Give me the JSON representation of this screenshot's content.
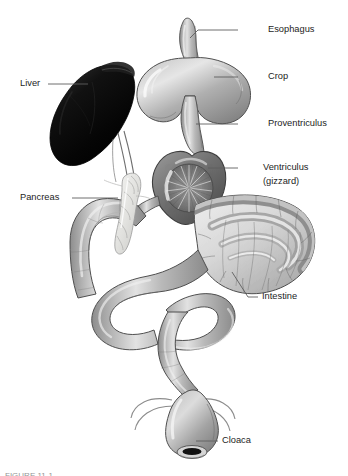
{
  "figure": {
    "caption_partial": "FIGURE 11-1",
    "background_color": "#ffffff",
    "line_color": "#5d5d5d",
    "text_color": "#1d1d1d"
  },
  "labels": [
    {
      "id": "esophagus",
      "text": "Esophagus",
      "text_x": 268,
      "text_y": 30,
      "leader": "M 238 30 L 198 30 L 190 38"
    },
    {
      "id": "crop",
      "text": "Crop",
      "text_x": 268,
      "text_y": 77,
      "leader": "M 238 77 L 214 77"
    },
    {
      "id": "proventriculus",
      "text": "Proventriculus",
      "text_x": 268,
      "text_y": 124,
      "leader": "M 238 124 L 196 124"
    },
    {
      "id": "ventriculus",
      "text": "Ventriculus",
      "text_x": 263,
      "text_y": 168,
      "leader": "M 238 168 L 208 168"
    },
    {
      "id": "ventriculus_sub",
      "text": "(gizzard)",
      "text_x": 263,
      "text_y": 182,
      "leader": ""
    },
    {
      "id": "pancreas",
      "text": "Pancreas",
      "text_x": 20,
      "text_y": 198,
      "leader": "M 72 198 L 118 198"
    },
    {
      "id": "liver",
      "text": "Liver",
      "text_x": 20,
      "text_y": 84,
      "leader": "M 48 84 L 88 84"
    },
    {
      "id": "intestine",
      "text": "Intestine",
      "text_x": 262,
      "text_y": 297,
      "leader": "M 258 297 L 248 297 L 232 272"
    },
    {
      "id": "cloaca",
      "text": "Cloaca",
      "text_x": 222,
      "text_y": 441,
      "leader": "M 218 441 L 196 441"
    }
  ],
  "organs": [
    {
      "id": "esophagus",
      "name": "Esophagus",
      "shade": "#9c9c9c"
    },
    {
      "id": "crop",
      "name": "Crop",
      "shade": "#a8a8a8"
    },
    {
      "id": "proventriculus",
      "name": "Proventriculus",
      "shade": "#9a9a9a"
    },
    {
      "id": "ventriculus",
      "name": "Ventriculus (gizzard)",
      "shade": "#6e6e6e"
    },
    {
      "id": "liver",
      "name": "Liver",
      "shade": "#0b0b0b"
    },
    {
      "id": "pancreas",
      "name": "Pancreas",
      "shade": "#e8e8e6"
    },
    {
      "id": "intestine",
      "name": "Intestine",
      "shade": "#9b9b9b"
    },
    {
      "id": "cloaca",
      "name": "Cloaca",
      "shade": "#8f8f8f"
    }
  ]
}
